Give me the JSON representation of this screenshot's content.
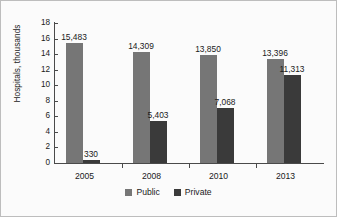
{
  "chart_data": {
    "type": "bar",
    "title": "",
    "subtitle": "",
    "xlabel": "",
    "ylabel": "Hospitals, thousands",
    "categories": [
      "2005",
      "2008",
      "2010",
      "2013"
    ],
    "ylim": [
      0,
      18
    ],
    "yticks": [
      0,
      2,
      4,
      6,
      8,
      10,
      12,
      14,
      16,
      18
    ],
    "ytick_labels": [
      "0",
      "2",
      "4",
      "6",
      "8",
      "10",
      "12",
      "14",
      "16",
      "18"
    ],
    "grid": false,
    "legend_position": "bottom",
    "units_note": "values are counts; bar heights are in thousands",
    "series": [
      {
        "name": "Public",
        "color": "#767676",
        "values": [
          15.483,
          14.309,
          13.85,
          13.396
        ],
        "data_labels": [
          "15,483",
          "14,309",
          "13,850",
          "13,396"
        ]
      },
      {
        "name": "Private",
        "color": "#3a3a3a",
        "values": [
          0.33,
          5.403,
          7.068,
          11.313
        ],
        "data_labels": [
          "330",
          "5,403",
          "7,068",
          "11,313"
        ]
      }
    ]
  },
  "legend": {
    "items": [
      {
        "label": "Public",
        "color": "#767676"
      },
      {
        "label": "Private",
        "color": "#3a3a3a"
      }
    ]
  }
}
